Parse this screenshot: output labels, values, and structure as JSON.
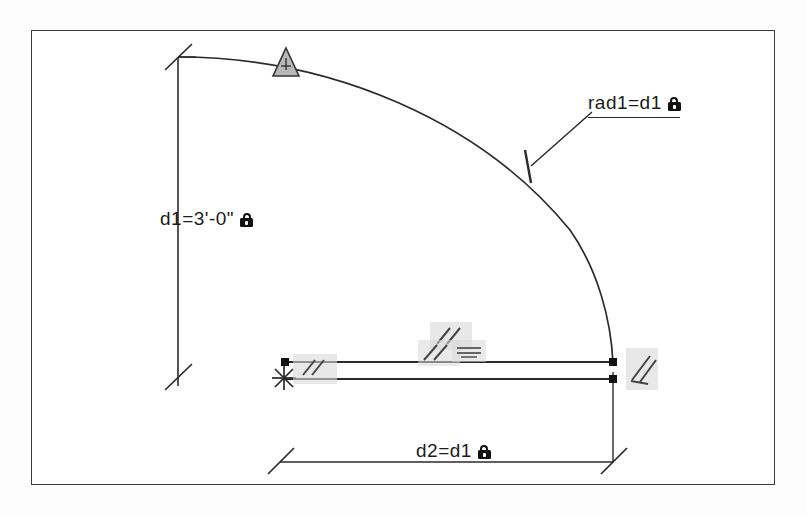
{
  "drawing": {
    "title": "Parametric CAD sketch with dimensional constraints",
    "frame": {
      "border_color": "#3a3a3a",
      "background": "#ffffff"
    },
    "line_color": "#2a2a2a",
    "constraint_badge_color": "#d9d9d9",
    "lock_color": "#111111"
  },
  "dimensions": [
    {
      "name": "vertical-dimension",
      "label": "d1=3'-0\"",
      "locked": true,
      "lock_icon": "padlock-icon",
      "orientation": "vertical"
    },
    {
      "name": "radius-dimension",
      "label": "rad1=d1",
      "locked": true,
      "lock_icon": "padlock-icon",
      "orientation": "leader"
    },
    {
      "name": "horizontal-dimension",
      "label": "d2=d1",
      "locked": true,
      "lock_icon": "padlock-icon",
      "orientation": "horizontal"
    }
  ],
  "constraints": [
    {
      "name": "tangent-marker",
      "symbol": "triangle",
      "position": "arc-top"
    },
    {
      "name": "radius-tick-marker",
      "symbol": "tick",
      "position": "arc-mid"
    },
    {
      "name": "parallel-marker-left",
      "symbol": "//",
      "position": "line-left"
    },
    {
      "name": "parallel-marker-center-upper",
      "symbol": "//",
      "position": "line-center-upper"
    },
    {
      "name": "parallel-marker-center-lower",
      "symbol": "//",
      "position": "line-center-lower"
    },
    {
      "name": "equal-marker-center",
      "symbol": "=",
      "position": "line-center"
    },
    {
      "name": "parallel-marker-right",
      "symbol": "//",
      "position": "line-right"
    },
    {
      "name": "anchor-point",
      "symbol": "asterisk",
      "position": "line-left-end"
    }
  ],
  "geometry": {
    "arc": {
      "name": "quarter-arc",
      "description": "quarter circle arc"
    },
    "lines": [
      {
        "name": "horizontal-line-upper"
      },
      {
        "name": "horizontal-line-lower"
      }
    ],
    "endpoints": [
      {
        "name": "endpoint-upper-left"
      },
      {
        "name": "endpoint-upper-right"
      },
      {
        "name": "endpoint-lower-right"
      }
    ]
  }
}
